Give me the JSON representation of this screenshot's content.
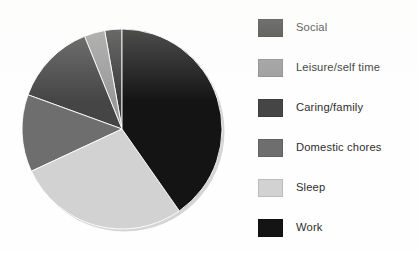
{
  "figure": {
    "background_color": "#fefefe",
    "text_color": "#2e2e2e"
  },
  "chart_data": {
    "type": "pie",
    "title": "",
    "subtitle": "",
    "xlabel": "",
    "ylabel": "",
    "grid": false,
    "legend_position": "right",
    "start_angle_deg": 0,
    "direction": "clockwise",
    "center": {
      "cx": 104,
      "cy": 105,
      "r": 100
    },
    "categories": [
      "Social",
      "Leisure/self time",
      "Caring/family",
      "Domestic chores",
      "Sleep",
      "Work"
    ],
    "values": [
      2.8,
      3.3,
      13.3,
      12.5,
      27.8,
      40.3
    ],
    "slices": [
      {
        "label": "Social",
        "value": 2.8,
        "color": "#3a3a3a",
        "start_deg": 350.0,
        "end_deg": 360.0
      },
      {
        "label": "Leisure/self time",
        "value": 3.3,
        "color": "#9a9a9a",
        "start_deg": 338.0,
        "end_deg": 350.0
      },
      {
        "label": "Caring/family",
        "value": 13.3,
        "color": "#454545",
        "start_deg": 290.0,
        "end_deg": 338.0
      },
      {
        "label": "Domestic chores",
        "value": 12.5,
        "color": "#6e6e6e",
        "start_deg": 245.0,
        "end_deg": 290.0
      },
      {
        "label": "Sleep",
        "value": 27.8,
        "color": "#d2d2d2",
        "start_deg": 145.0,
        "end_deg": 245.0
      },
      {
        "label": "Work",
        "value": 40.3,
        "color": "#141414",
        "start_deg": 0.0,
        "end_deg": 145.0
      }
    ]
  },
  "legend": {
    "items": [
      {
        "label": "Social",
        "color": "#3a3a3a"
      },
      {
        "label": "Leisure/self time",
        "color": "#9a9a9a"
      },
      {
        "label": "Caring/family",
        "color": "#454545"
      },
      {
        "label": "Domestic chores",
        "color": "#6e6e6e"
      },
      {
        "label": "Sleep",
        "color": "#d2d2d2"
      },
      {
        "label": "Work",
        "color": "#141414"
      }
    ]
  }
}
